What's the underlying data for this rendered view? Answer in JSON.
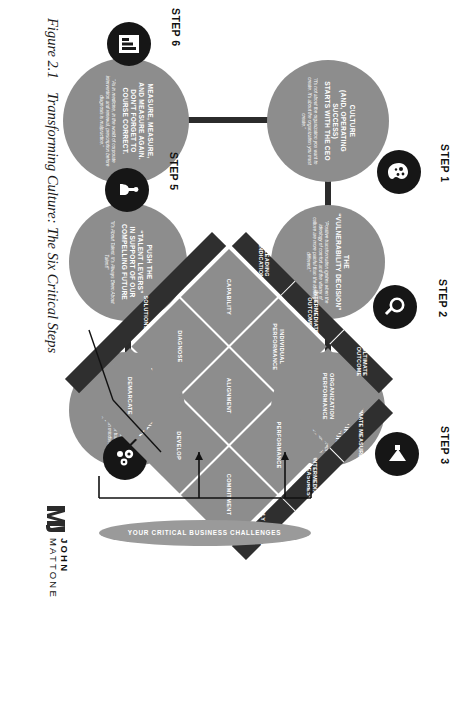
{
  "caption": {
    "number": "Figure 2.1",
    "text": "Transforming Culture: The Six Critical Steps"
  },
  "logo": {
    "line1": "JOHN",
    "line2": "MATTONE",
    "mark_name": "jm-monogram-icon"
  },
  "steps": [
    {
      "label": "STEP 1",
      "title": "CULTURE\n(AND, OPERATING SUCCESS)\nSTARTS WITH THE CEO",
      "title_lines": [
        "CULTURE",
        "(AND, OPERATING",
        "SUCCESS)",
        "STARTS WITH THE CEO"
      ],
      "sub": "\"It's not about the organization you want to create. It's about the organization you must create.\"",
      "icon": "ceo-head-megaphone-icon"
    },
    {
      "label": "STEP 2",
      "title_lines": [
        "THE",
        "\"VULNERABILITY DECISION\""
      ],
      "sub": "\"Positive transformation ignites when the ideology of comfort and the vitamy of culture are more painful than the ideology of different.\"",
      "icon": "magnifier-icon"
    },
    {
      "label": "STEP 3",
      "title_lines": [
        "CREATE YOUR",
        "COMPELLING FUTURE"
      ],
      "sub": "\"The CEO and C-Level team must accept responsibility for creating the organization's compelling future blueprint and architecture.\"",
      "icon": "megaphone-icon"
    },
    {
      "label": "STEP 4",
      "title_lines": [
        "TRANSFORM MINDSETS.",
        "TRANSFORM BEHAVIOR.",
        "TRANSFORM RESULTS."
      ],
      "sub": "\"Culture transforms when people transform. Results transform when behavior transforms. Behavior transforms when mindsets transform.\"",
      "icon": "gears-people-icon"
    },
    {
      "label": "STEP 5",
      "title_lines": [
        "PUSH THE",
        "\"TALENT LEVERS\"",
        "IN SUPPORT OF OUR",
        "COMPELLING FUTURE"
      ],
      "sub": "\"It's About Talent. It's Always Been About Talent!\"",
      "icon": "hand-lever-icon"
    },
    {
      "label": "STEP 6",
      "title_lines": [
        "MEASURE, MEASURE,",
        "AND MEASURE AGAIN.",
        "DON'T FORGET TO",
        "COURSE CORRECT."
      ],
      "sub": "\"As in medicine, in the world of corporate intervention and renewal, prescription before diagnosis is malpractice.\"",
      "icon": "bar-chart-clipboard-icon"
    }
  ],
  "matrix": {
    "top_axis": [
      "ULTIMATE MEASURES",
      "INTERMEDIATE MEASURES",
      "EARLY MEASURES"
    ],
    "left_axis": [
      "ULTIMATE OUTCOME",
      "INTERMEDIATE OUTCOME",
      "LEADING INDICATIONS"
    ],
    "cells": [
      [
        "ORGANIZATION PERFORMANCE",
        "PERFORMANCE",
        "COMMITMENT"
      ],
      [
        "INDIVIDUAL PERFORMANCE",
        "ALIGNMENT",
        "DEVELOP"
      ],
      [
        "CAPABILITY",
        "DIAGNOSE",
        "DEMARCATE"
      ]
    ],
    "cells_flat": [
      "ORGANIZATION PERFORMANCE",
      "PERFORMANCE",
      "COMMITMENT",
      "INDIVIDUAL PERFORMANCE",
      "ALIGNMENT",
      "DEVELOP",
      "CAPABILITY",
      "DIAGNOSE",
      "DEMARCATE"
    ],
    "row_right_labels": [
      "DEMARCATE",
      "DEVELOP",
      "DIAGNOSE",
      "DEPLOY"
    ],
    "solutions_label": "SOLUTIONS",
    "extra_cells": [
      "DEPLOY"
    ]
  },
  "challenges": {
    "label": "YOUR CRITICAL BUSINESS CHALLENGES"
  },
  "colors": {
    "circle_gray": "#8d8d8d",
    "badge_black": "#161616",
    "bar_dark": "#2b2b2b",
    "axis_dark": "#2f2f2f",
    "oval_gray": "#9a9a9a",
    "text_white": "#ffffff",
    "page_white": "#ffffff"
  }
}
